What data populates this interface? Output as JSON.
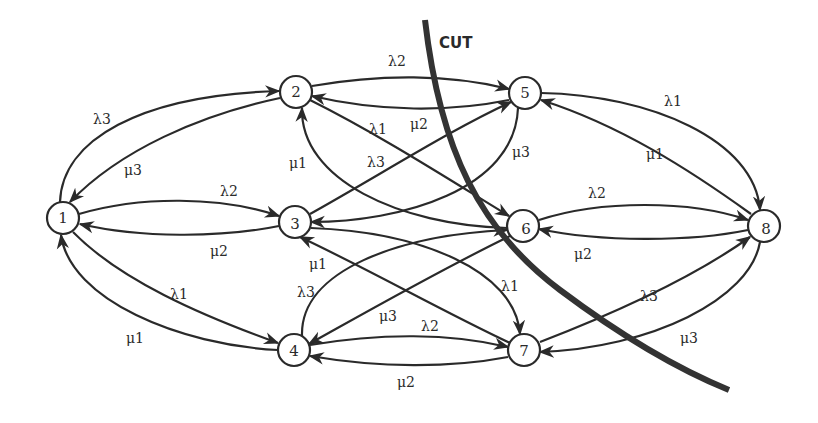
{
  "diagram": {
    "cut_label": "CUT",
    "nodes": [
      {
        "id": "1",
        "label": "1",
        "x": 63,
        "y": 218
      },
      {
        "id": "2",
        "label": "2",
        "x": 296,
        "y": 92
      },
      {
        "id": "3",
        "label": "3",
        "x": 295,
        "y": 222
      },
      {
        "id": "4",
        "label": "4",
        "x": 294,
        "y": 350
      },
      {
        "id": "5",
        "label": "5",
        "x": 525,
        "y": 93
      },
      {
        "id": "6",
        "label": "6",
        "x": 523,
        "y": 226
      },
      {
        "id": "7",
        "label": "7",
        "x": 524,
        "y": 350
      },
      {
        "id": "8",
        "label": "8",
        "x": 764,
        "y": 226
      }
    ],
    "edges": [
      {
        "from": "1",
        "to": "2",
        "label": "λ3"
      },
      {
        "from": "2",
        "to": "1",
        "label": "μ3"
      },
      {
        "from": "1",
        "to": "3",
        "label": "λ2"
      },
      {
        "from": "3",
        "to": "1",
        "label": "μ2"
      },
      {
        "from": "1",
        "to": "4",
        "label": "λ1"
      },
      {
        "from": "4",
        "to": "1",
        "label": "μ1"
      },
      {
        "from": "2",
        "to": "5",
        "label": "λ2"
      },
      {
        "from": "5",
        "to": "2",
        "label": "μ2"
      },
      {
        "from": "2",
        "to": "6",
        "label": "λ1"
      },
      {
        "from": "6",
        "to": "2",
        "label": "μ1"
      },
      {
        "from": "3",
        "to": "5",
        "label": "λ3"
      },
      {
        "from": "5",
        "to": "3",
        "label": "μ3"
      },
      {
        "from": "3",
        "to": "7",
        "label": "λ1"
      },
      {
        "from": "7",
        "to": "3",
        "label": "μ1"
      },
      {
        "from": "4",
        "to": "6",
        "label": "λ3"
      },
      {
        "from": "6",
        "to": "4",
        "label": "μ3"
      },
      {
        "from": "4",
        "to": "7",
        "label": "λ2"
      },
      {
        "from": "7",
        "to": "4",
        "label": "μ2"
      },
      {
        "from": "5",
        "to": "8",
        "label": "λ1"
      },
      {
        "from": "8",
        "to": "5",
        "label": "μ1"
      },
      {
        "from": "6",
        "to": "8",
        "label": "λ2"
      },
      {
        "from": "8",
        "to": "6",
        "label": "μ2"
      },
      {
        "from": "7",
        "to": "8",
        "label": "λ3"
      },
      {
        "from": "8",
        "to": "7",
        "label": "μ3"
      }
    ],
    "labels": {
      "l_1_2": "λ3",
      "l_2_1": "μ3",
      "l_1_3": "λ2",
      "l_3_1": "μ2",
      "l_1_4": "λ1",
      "l_4_1": "μ1",
      "l_2_5": "λ2",
      "l_5_2": "μ2",
      "l_2_6": "λ1",
      "l_6_2": "μ1",
      "l_3_5": "λ3",
      "l_5_3": "μ3",
      "l_3_7": "λ1",
      "l_7_3": "μ1",
      "l_4_6": "λ3",
      "l_6_4": "μ3",
      "l_4_7": "λ2",
      "l_7_4": "μ2",
      "l_5_8": "λ1",
      "l_8_5": "μ1",
      "l_6_8": "λ2",
      "l_8_6": "μ2",
      "l_7_8": "λ3",
      "l_8_7": "μ3"
    },
    "node_labels": {
      "n1": "1",
      "n2": "2",
      "n3": "3",
      "n4": "4",
      "n5": "5",
      "n6": "6",
      "n7": "7",
      "n8": "8"
    },
    "colors": {
      "ink": "#2a2a2a",
      "cut": "#333333",
      "background": "#ffffff"
    }
  }
}
